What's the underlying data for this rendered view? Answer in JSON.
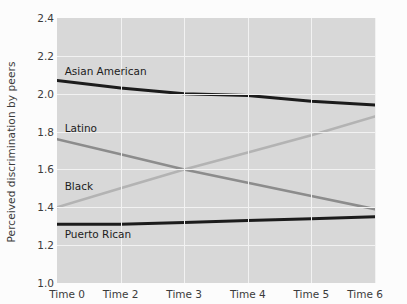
{
  "chart_data": {
    "type": "line",
    "title": "",
    "xlabel": "",
    "ylabel": "Perceived discrimination by peers",
    "categories": [
      "Time 0",
      "Time 2",
      "Time 3",
      "Time 4",
      "Time 5",
      "Time 6"
    ],
    "x": [
      0,
      1,
      2,
      3,
      4,
      5
    ],
    "ylim": [
      1.0,
      2.4
    ],
    "yticks": [
      "1.0",
      "1.2",
      "1.4",
      "1.6",
      "1.8",
      "2.0",
      "2.2",
      "2.4"
    ],
    "ytick_values": [
      1.0,
      1.2,
      1.4,
      1.6,
      1.8,
      2.0,
      2.2,
      2.4
    ],
    "grid": true,
    "legend_position": "inline-labels",
    "plot_background": "#d8d8d8",
    "gridline_color": "#f2f2f2",
    "series": [
      {
        "name": "Asian American",
        "color": "#1c1c1c",
        "width": 3.0,
        "values": [
          2.07,
          2.03,
          2.0,
          1.99,
          1.96,
          1.94
        ],
        "label_x": 0.12,
        "label_y": 2.12
      },
      {
        "name": "Latino",
        "color": "#8c8c8c",
        "width": 2.6,
        "values": [
          1.76,
          1.68,
          1.6,
          1.53,
          1.46,
          1.39
        ],
        "label_x": 0.12,
        "label_y": 1.82
      },
      {
        "name": "Black",
        "color": "#b3b3b3",
        "width": 2.6,
        "values": [
          1.4,
          1.5,
          1.6,
          1.69,
          1.78,
          1.88
        ],
        "label_x": 0.12,
        "label_y": 1.51
      },
      {
        "name": "Puerto Rican",
        "color": "#1c1c1c",
        "width": 3.0,
        "values": [
          1.31,
          1.31,
          1.32,
          1.33,
          1.34,
          1.35
        ],
        "label_x": 0.12,
        "label_y": 1.26
      }
    ]
  }
}
